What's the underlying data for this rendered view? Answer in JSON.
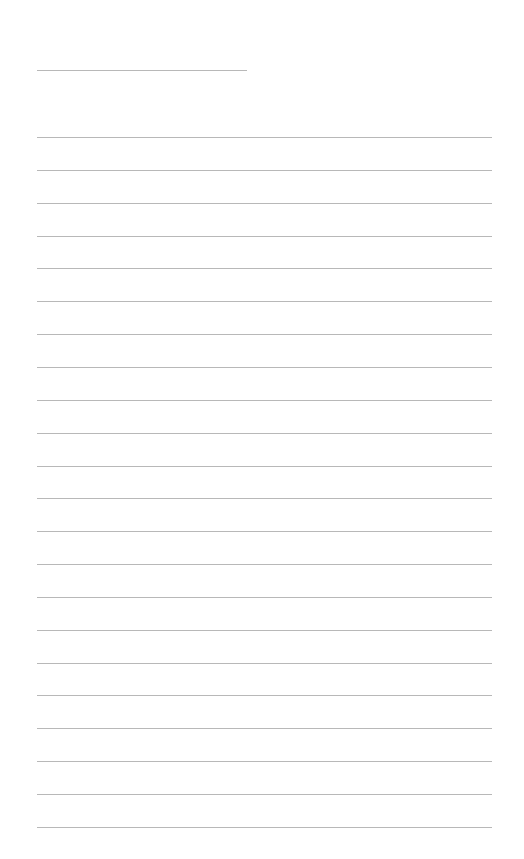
{
  "page": {
    "type": "lined-paper",
    "background_color": "#ffffff",
    "line_color": "#b8b8b8",
    "header_bleed_text": "",
    "title_line": {
      "left": 37,
      "top": 70,
      "width": 210
    },
    "ruled_lines": {
      "count": 22,
      "left": 37,
      "first_top": 137,
      "spacing": 32.85,
      "width": 455
    }
  }
}
